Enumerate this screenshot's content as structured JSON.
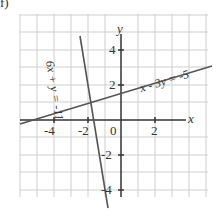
{
  "problem_label": "f)",
  "axes": {
    "x_label": "x",
    "y_label": "y",
    "origin_label": "0",
    "x_ticks": [
      "-4",
      "-2",
      "2"
    ],
    "y_ticks": [
      "4",
      "2",
      "-2",
      "-4"
    ]
  },
  "lines": [
    {
      "equation": "6x + y = -11",
      "color": "#555555"
    },
    {
      "equation": "x - 3y = -5",
      "color": "#555555"
    }
  ],
  "colors": {
    "grid": "#cfcfcf",
    "axis": "#333333",
    "line": "#555555"
  }
}
